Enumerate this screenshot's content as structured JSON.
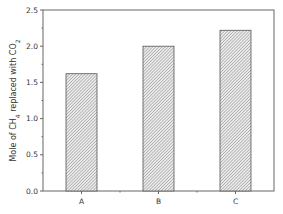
{
  "chart_data": {
    "type": "bar",
    "title": "",
    "xlabel": "",
    "ylabel": "Mole of CH4 replaced with CO2",
    "ylabel_parts": {
      "pre": "Mole of CH",
      "sub1": "4",
      "mid": " replaced with CO",
      "sub2": "2"
    },
    "categories": [
      "A",
      "B",
      "C"
    ],
    "values": [
      1.62,
      2.0,
      2.22
    ],
    "ylim": [
      0,
      2.5
    ],
    "yticks": [
      "0.0",
      "0.5",
      "1.0",
      "1.5",
      "2.0",
      "2.5"
    ],
    "grid": false,
    "legend": null,
    "bar_style": {
      "fill": "hatched",
      "hatch": "diagonal",
      "edge_color": "#555555",
      "fill_color": "#d8d8d8"
    }
  }
}
